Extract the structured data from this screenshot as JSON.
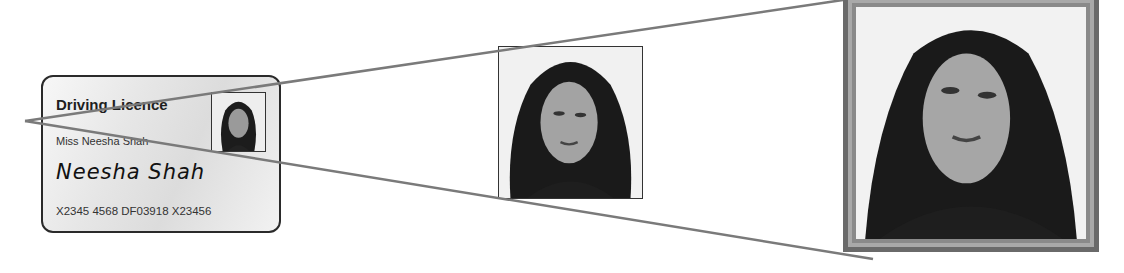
{
  "card": {
    "title": "Driving Licence",
    "name": "Miss Neesha Shah",
    "signature": "Neesha Shah",
    "number": "X2345 4568 DF03918 X23456"
  },
  "photos": {
    "card_photo": "portrait-photo",
    "enlarged_photo": "portrait-photo",
    "framed_photo": "portrait-photo"
  },
  "colors": {
    "line": "#7a7a7a",
    "card_border": "#2a2a2a",
    "frame": "#6a6a6a"
  }
}
